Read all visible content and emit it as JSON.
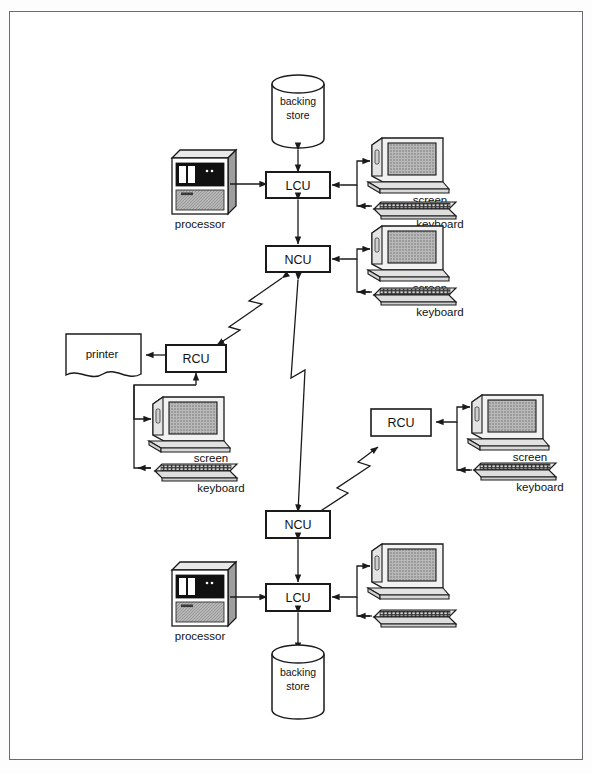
{
  "diagram": {
    "type": "network-topology-diagram",
    "title": "",
    "border_color": "#6a6a70",
    "background_color": "#ffffff",
    "line_color": "#1a1a1a",
    "nodes": [
      {
        "id": "backing-store-top",
        "kind": "backing-store",
        "label": "backing\nstore",
        "line1": "backing",
        "line2": "store",
        "x": 298,
        "y": 105
      },
      {
        "id": "lcu-top",
        "kind": "control-unit",
        "label": "LCU",
        "x": 298,
        "y": 185
      },
      {
        "id": "processor-top",
        "kind": "processor",
        "label": "processor",
        "x": 200,
        "y": 183
      },
      {
        "id": "ncu-top",
        "kind": "control-unit",
        "label": "NCU",
        "x": 298,
        "y": 259
      },
      {
        "id": "screen-top-1",
        "kind": "screen",
        "label": "screen",
        "x": 404,
        "y": 168
      },
      {
        "id": "keyboard-top-1",
        "kind": "keyboard",
        "label": "keyboard",
        "x": 404,
        "y": 208
      },
      {
        "id": "screen-top-2",
        "kind": "screen",
        "label": "screen",
        "x": 404,
        "y": 255
      },
      {
        "id": "keyboard-top-2",
        "kind": "keyboard",
        "label": "keyboard",
        "x": 404,
        "y": 295
      },
      {
        "id": "rcu-left",
        "kind": "control-unit",
        "label": "RCU",
        "x": 196,
        "y": 359
      },
      {
        "id": "printer",
        "kind": "printer",
        "label": "printer",
        "x": 100,
        "y": 355
      },
      {
        "id": "screen-left",
        "kind": "screen",
        "label": "screen",
        "x": 185,
        "y": 425
      },
      {
        "id": "keyboard-left",
        "kind": "keyboard",
        "label": "keyboard",
        "x": 185,
        "y": 470
      },
      {
        "id": "rcu-right",
        "kind": "control-unit",
        "label": "RCU",
        "x": 400,
        "y": 423
      },
      {
        "id": "screen-right",
        "kind": "screen",
        "label": "screen",
        "x": 502,
        "y": 424
      },
      {
        "id": "keyboard-right",
        "kind": "keyboard",
        "label": "keyboard",
        "x": 502,
        "y": 470
      },
      {
        "id": "ncu-bottom",
        "kind": "control-unit",
        "label": "NCU",
        "x": 298,
        "y": 524
      },
      {
        "id": "lcu-bottom",
        "kind": "control-unit",
        "label": "LCU",
        "x": 298,
        "y": 597
      },
      {
        "id": "processor-bottom",
        "kind": "processor",
        "label": "processor",
        "x": 200,
        "y": 595
      },
      {
        "id": "backing-store-bottom",
        "kind": "backing-store",
        "label": "backing\nstore",
        "line1": "backing",
        "line2": "store",
        "x": 298,
        "y": 676
      },
      {
        "id": "screen-bottom",
        "kind": "screen",
        "label": "",
        "x": 404,
        "y": 573
      },
      {
        "id": "keyboard-bottom",
        "kind": "keyboard",
        "label": "",
        "x": 404,
        "y": 617
      }
    ],
    "labels": {
      "backing_store_line1": "backing",
      "backing_store_line2": "store",
      "lcu": "LCU",
      "ncu": "NCU",
      "rcu": "RCU",
      "processor": "processor",
      "printer": "printer",
      "screen": "screen",
      "keyboard": "keyboard"
    },
    "links": [
      {
        "from": "backing-store-top",
        "to": "lcu-top",
        "style": "double-arrow"
      },
      {
        "from": "processor-top",
        "to": "lcu-top",
        "style": "arrow"
      },
      {
        "from": "lcu-top",
        "to": "ncu-top",
        "style": "double-arrow"
      },
      {
        "from": "lcu-top",
        "to": "screen-top-1",
        "style": "arrow-bus"
      },
      {
        "from": "keyboard-top-1",
        "to": "lcu-top",
        "style": "arrow-bus"
      },
      {
        "from": "ncu-top",
        "to": "screen-top-2",
        "style": "arrow-bus"
      },
      {
        "from": "keyboard-top-2",
        "to": "ncu-top",
        "style": "arrow-bus"
      },
      {
        "from": "ncu-top",
        "to": "rcu-left",
        "style": "lightning-double-arrow"
      },
      {
        "from": "ncu-top",
        "to": "ncu-bottom",
        "style": "lightning-double-arrow"
      },
      {
        "from": "ncu-bottom",
        "to": "rcu-right",
        "style": "lightning-double-arrow"
      },
      {
        "from": "rcu-left",
        "to": "printer",
        "style": "arrow"
      },
      {
        "from": "rcu-left",
        "to": "screen-left",
        "style": "arrow-bus"
      },
      {
        "from": "keyboard-left",
        "to": "rcu-left",
        "style": "arrow-bus"
      },
      {
        "from": "rcu-right",
        "to": "screen-right",
        "style": "double-arrow"
      },
      {
        "from": "keyboard-right",
        "to": "rcu-right",
        "style": "arrow-bus"
      },
      {
        "from": "ncu-bottom",
        "to": "lcu-bottom",
        "style": "double-arrow"
      },
      {
        "from": "processor-bottom",
        "to": "lcu-bottom",
        "style": "arrow"
      },
      {
        "from": "lcu-bottom",
        "to": "backing-store-bottom",
        "style": "double-arrow"
      },
      {
        "from": "lcu-bottom",
        "to": "screen-bottom",
        "style": "arrow-bus"
      },
      {
        "from": "keyboard-bottom",
        "to": "lcu-bottom",
        "style": "arrow-bus"
      }
    ]
  }
}
